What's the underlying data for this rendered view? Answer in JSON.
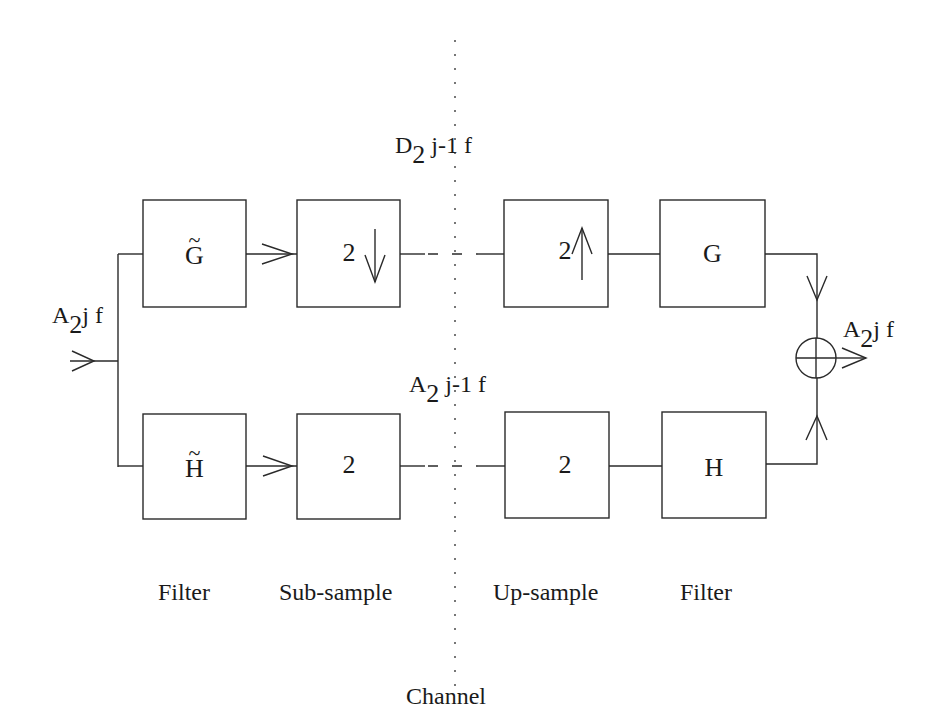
{
  "diagram": {
    "input_signal": {
      "base": "A",
      "sub": "2",
      "rest": "j f"
    },
    "output_signal": {
      "base": "A",
      "sub": "2",
      "rest": "j f"
    },
    "detail_signal": {
      "base": "D",
      "sub": "2",
      "rest": " j-1 f"
    },
    "approx_signal": {
      "base": "A",
      "sub": "2",
      "rest": " j-1 f"
    },
    "top_branch": {
      "analysis_filter": {
        "symbol": "G",
        "tilde": "~"
      },
      "downsample": {
        "factor": "2",
        "arrow": "↓"
      },
      "upsample": {
        "factor": "2",
        "arrow": "↑"
      },
      "synthesis_filter": {
        "symbol": "G"
      }
    },
    "bottom_branch": {
      "analysis_filter": {
        "symbol": "H",
        "tilde": "~"
      },
      "downsample": {
        "factor": "2",
        "arrow": "↓"
      },
      "upsample": {
        "factor": "2",
        "arrow": "↑"
      },
      "synthesis_filter": {
        "symbol": "H"
      }
    },
    "summing_node": {
      "symbol": "plus-circle"
    },
    "stage_captions": [
      "Filter",
      "Sub-sample",
      "Up-sample",
      "Filter"
    ],
    "channel_label": "Channel",
    "colors": {
      "line": "#2a2a2a",
      "background": "#ffffff",
      "text": "#1a1a1a"
    }
  }
}
